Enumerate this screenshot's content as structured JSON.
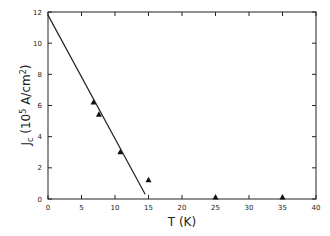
{
  "chart_data": {
    "type": "scatter",
    "title": "",
    "xlabel": "T (K)",
    "ylabel": "J_c (10^5 A/cm^2)",
    "ylabel_parts": {
      "main": "J",
      "sub": "c",
      "unit_pre": "(10",
      "sup1": "5",
      "unit_mid": " A/cm",
      "sup2": "2",
      "unit_post": ")"
    },
    "xlim": [
      0,
      40
    ],
    "ylim": [
      0,
      12
    ],
    "xticks": [
      0,
      5,
      10,
      15,
      20,
      25,
      30,
      35,
      40
    ],
    "yticks": [
      0,
      2,
      4,
      6,
      8,
      10,
      12
    ],
    "grid": false,
    "legend": null,
    "series": [
      {
        "name": "measured",
        "marker": "triangle",
        "x": [
          6.8,
          7.6,
          10.8,
          15.0,
          25.0,
          35.0
        ],
        "y": [
          6.2,
          5.4,
          3.0,
          1.2,
          0.1,
          0.1
        ]
      },
      {
        "name": "linear fit",
        "marker": "line",
        "x": [
          0,
          14.5
        ],
        "y": [
          11.8,
          0.3
        ]
      }
    ]
  }
}
